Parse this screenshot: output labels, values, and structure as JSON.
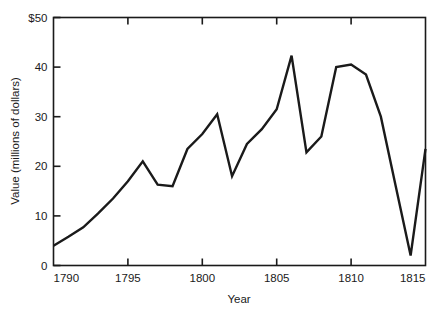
{
  "chart_data": {
    "type": "line",
    "title": "",
    "subtitle": "",
    "xlabel": "Year",
    "ylabel": "Value (millions of dollars)",
    "xlim": [
      1790,
      1815
    ],
    "ylim": [
      0,
      50
    ],
    "grid": false,
    "legend": null,
    "line_color": "#1a1a1a",
    "xticks": [
      1790,
      1795,
      1800,
      1805,
      1810,
      1815
    ],
    "xtick_labels": [
      "1790",
      "1795",
      "1800",
      "1805",
      "1810",
      "1815"
    ],
    "yticks": [
      0,
      10,
      20,
      30,
      40,
      50
    ],
    "ytick_labels": [
      "0",
      "10",
      "20",
      "30",
      "40",
      "$50"
    ],
    "x": [
      1790,
      1791,
      1792,
      1793,
      1794,
      1795,
      1796,
      1797,
      1798,
      1799,
      1800,
      1801,
      1802,
      1803,
      1804,
      1805,
      1806,
      1807,
      1808,
      1809,
      1810,
      1811,
      1812,
      1813,
      1814,
      1815
    ],
    "values": [
      4.0,
      5.8,
      7.7,
      10.5,
      13.5,
      17.0,
      21.0,
      16.3,
      16.0,
      23.5,
      26.5,
      30.5,
      18.0,
      24.5,
      27.5,
      31.5,
      42.3,
      22.8,
      26.0,
      40.0,
      40.5,
      38.5,
      30.0,
      16.0,
      2.0,
      23.5
    ],
    "series_name": "Value"
  },
  "axes": {
    "y_axis_title": "Value (millions of dollars)",
    "x_axis_title": "Year"
  }
}
